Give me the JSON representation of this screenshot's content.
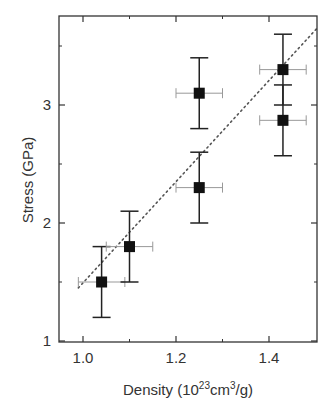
{
  "chart_data": {
    "type": "scatter",
    "title": "",
    "xlabel": "Density (10^23 cm^3/g)",
    "xlabel_parts": {
      "main": "Density (10",
      "sup1": "23",
      "mid": "cm",
      "sup2": "3",
      "end": "/g)"
    },
    "ylabel": "Stress (GPa)",
    "xlim": [
      0.93,
      1.5
    ],
    "ylim": [
      1.0,
      3.72
    ],
    "xticks": [
      1.0,
      1.2,
      1.4
    ],
    "xtick_labels": [
      "1.0",
      "1.2",
      "1.4"
    ],
    "xminor_ticks": [
      1.1,
      1.3
    ],
    "yticks": [
      1,
      2,
      3
    ],
    "ytick_labels": [
      "1",
      "2",
      "3"
    ],
    "yminor_ticks": [
      1.5,
      2.5,
      3.5
    ],
    "grid": false,
    "legend": null,
    "series": [
      {
        "name": "data",
        "marker": "filled-square",
        "color": "#111111",
        "points": [
          {
            "x": 1.04,
            "y": 1.5,
            "xerr": 0.05,
            "yerr": 0.3
          },
          {
            "x": 1.1,
            "y": 1.8,
            "xerr": 0.05,
            "yerr": 0.3
          },
          {
            "x": 1.25,
            "y": 3.1,
            "xerr": 0.05,
            "yerr": 0.3
          },
          {
            "x": 1.25,
            "y": 2.3,
            "xerr": 0.05,
            "yerr": 0.3
          },
          {
            "x": 1.43,
            "y": 3.3,
            "xerr": 0.05,
            "yerr": 0.3
          },
          {
            "x": 1.43,
            "y": 2.87,
            "xerr": 0.05,
            "yerr": 0.3
          }
        ]
      },
      {
        "name": "linear fit",
        "style": "dotted",
        "color": "#555555",
        "x": [
          0.99,
          1.5
        ],
        "y": [
          1.45,
          3.65
        ]
      }
    ]
  }
}
